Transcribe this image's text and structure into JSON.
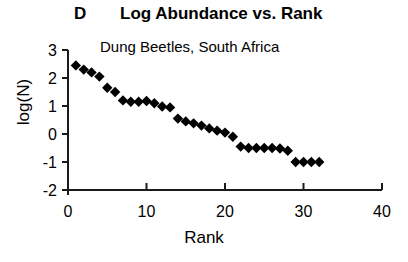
{
  "panel": {
    "letter": "D",
    "title": "Log Abundance vs. Rank"
  },
  "annotation": "Dung Beetles, South Africa",
  "axes": {
    "xlabel": "Rank",
    "ylabel": "log(N)",
    "x_ticks": [
      "0",
      "10",
      "20",
      "30",
      "40"
    ],
    "y_ticks": [
      "3",
      "2",
      "1",
      "0",
      "-1",
      "-2"
    ]
  },
  "chart_data": {
    "type": "scatter",
    "title": "Log Abundance vs. Rank",
    "panel_label": "D",
    "annotation": "Dung Beetles, South Africa",
    "xlabel": "Rank",
    "ylabel": "log(N)",
    "xlim": [
      0,
      40
    ],
    "ylim": [
      -2,
      3
    ],
    "x_ticks": [
      0,
      10,
      20,
      30,
      40
    ],
    "y_ticks": [
      3,
      2,
      1,
      0,
      -1,
      -2
    ],
    "grid": false,
    "legend": false,
    "marker": "diamond",
    "marker_color": "#000000",
    "n_points": 32,
    "x": [
      1,
      2,
      3,
      4,
      5,
      6,
      7,
      8,
      9,
      10,
      11,
      12,
      13,
      14,
      15,
      16,
      17,
      18,
      19,
      20,
      21,
      22,
      23,
      24,
      25,
      26,
      27,
      28,
      29,
      30,
      31,
      32
    ],
    "y": [
      2.45,
      2.3,
      2.2,
      2.05,
      1.65,
      1.5,
      1.2,
      1.15,
      1.15,
      1.18,
      1.1,
      0.98,
      0.95,
      0.55,
      0.45,
      0.38,
      0.3,
      0.2,
      0.12,
      0.05,
      -0.1,
      -0.45,
      -0.5,
      -0.5,
      -0.5,
      -0.5,
      -0.52,
      -0.6,
      -1.0,
      -1.0,
      -1.0,
      -1.0
    ]
  }
}
